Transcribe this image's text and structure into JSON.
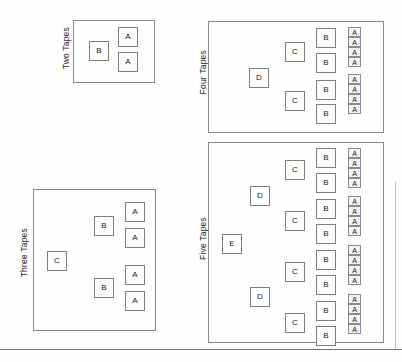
{
  "figure": {
    "background_color": "#fefefe",
    "line_color": "#8a8a8a",
    "node_fill": "#fdfdfd",
    "small_node_fill": "#f3f3f3",
    "text_color": "#171717"
  },
  "panels": [
    {
      "id": "two-tapes",
      "label": "Two Tapes",
      "x": 73,
      "y": 20,
      "w": 82,
      "h": 63,
      "label_x": 62,
      "label_y": 27,
      "nodes": [
        {
          "letter": "B",
          "size": "big",
          "x": 89,
          "y": 41
        },
        {
          "letter": "A",
          "size": "big",
          "x": 118,
          "y": 27
        },
        {
          "letter": "A",
          "size": "big",
          "x": 118,
          "y": 52
        }
      ]
    },
    {
      "id": "three-tapes",
      "label": "Three Tapes",
      "x": 33,
      "y": 189,
      "w": 123,
      "h": 142,
      "label_x": 20,
      "label_y": 228,
      "nodes": [
        {
          "letter": "C",
          "size": "big",
          "x": 47,
          "y": 251
        },
        {
          "letter": "B",
          "size": "big",
          "x": 94,
          "y": 216
        },
        {
          "letter": "B",
          "size": "big",
          "x": 94,
          "y": 278
        },
        {
          "letter": "A",
          "size": "big",
          "x": 125,
          "y": 202
        },
        {
          "letter": "A",
          "size": "big",
          "x": 125,
          "y": 228
        },
        {
          "letter": "A",
          "size": "big",
          "x": 125,
          "y": 265
        },
        {
          "letter": "A",
          "size": "big",
          "x": 125,
          "y": 291
        }
      ]
    },
    {
      "id": "four-tapes",
      "label": "Four Tapes",
      "x": 208,
      "y": 21,
      "w": 176,
      "h": 112,
      "label_x": 199,
      "label_y": 50,
      "nodes": [
        {
          "letter": "D",
          "size": "big",
          "x": 249,
          "y": 68
        },
        {
          "letter": "C",
          "size": "big",
          "x": 285,
          "y": 42
        },
        {
          "letter": "C",
          "size": "big",
          "x": 285,
          "y": 91
        },
        {
          "letter": "B",
          "size": "big",
          "x": 316,
          "y": 28
        },
        {
          "letter": "B",
          "size": "big",
          "x": 316,
          "y": 53
        },
        {
          "letter": "B",
          "size": "big",
          "x": 316,
          "y": 80
        },
        {
          "letter": "B",
          "size": "big",
          "x": 316,
          "y": 104
        },
        {
          "letter": "A",
          "size": "small",
          "x": 348,
          "y": 27
        },
        {
          "letter": "A",
          "size": "small",
          "x": 348,
          "y": 37
        },
        {
          "letter": "A",
          "size": "small",
          "x": 348,
          "y": 47
        },
        {
          "letter": "A",
          "size": "small",
          "x": 348,
          "y": 57
        },
        {
          "letter": "A",
          "size": "small",
          "x": 348,
          "y": 74
        },
        {
          "letter": "A",
          "size": "small",
          "x": 348,
          "y": 84
        },
        {
          "letter": "A",
          "size": "small",
          "x": 348,
          "y": 94
        },
        {
          "letter": "A",
          "size": "small",
          "x": 348,
          "y": 104
        }
      ]
    },
    {
      "id": "five-tapes",
      "label": "Five Tapes",
      "x": 208,
      "y": 142,
      "w": 176,
      "h": 201,
      "label_x": 199,
      "label_y": 217,
      "nodes": [
        {
          "letter": "E",
          "size": "big",
          "x": 222,
          "y": 234
        },
        {
          "letter": "D",
          "size": "big",
          "x": 250,
          "y": 186
        },
        {
          "letter": "D",
          "size": "big",
          "x": 250,
          "y": 287
        },
        {
          "letter": "C",
          "size": "big",
          "x": 285,
          "y": 160
        },
        {
          "letter": "C",
          "size": "big",
          "x": 285,
          "y": 211
        },
        {
          "letter": "C",
          "size": "big",
          "x": 285,
          "y": 262
        },
        {
          "letter": "C",
          "size": "big",
          "x": 285,
          "y": 313
        },
        {
          "letter": "B",
          "size": "big",
          "x": 316,
          "y": 148
        },
        {
          "letter": "B",
          "size": "big",
          "x": 316,
          "y": 173
        },
        {
          "letter": "B",
          "size": "big",
          "x": 316,
          "y": 199
        },
        {
          "letter": "B",
          "size": "big",
          "x": 316,
          "y": 224
        },
        {
          "letter": "B",
          "size": "big",
          "x": 316,
          "y": 250
        },
        {
          "letter": "B",
          "size": "big",
          "x": 316,
          "y": 275
        },
        {
          "letter": "B",
          "size": "big",
          "x": 316,
          "y": 301
        },
        {
          "letter": "B",
          "size": "big",
          "x": 316,
          "y": 326
        },
        {
          "letter": "A",
          "size": "small",
          "x": 348,
          "y": 148
        },
        {
          "letter": "A",
          "size": "small",
          "x": 348,
          "y": 158
        },
        {
          "letter": "A",
          "size": "small",
          "x": 348,
          "y": 168
        },
        {
          "letter": "A",
          "size": "small",
          "x": 348,
          "y": 178
        },
        {
          "letter": "A",
          "size": "small",
          "x": 348,
          "y": 196
        },
        {
          "letter": "A",
          "size": "small",
          "x": 348,
          "y": 206
        },
        {
          "letter": "A",
          "size": "small",
          "x": 348,
          "y": 216
        },
        {
          "letter": "A",
          "size": "small",
          "x": 348,
          "y": 226
        },
        {
          "letter": "A",
          "size": "small",
          "x": 348,
          "y": 245
        },
        {
          "letter": "A",
          "size": "small",
          "x": 348,
          "y": 255
        },
        {
          "letter": "A",
          "size": "small",
          "x": 348,
          "y": 265
        },
        {
          "letter": "A",
          "size": "small",
          "x": 348,
          "y": 275
        },
        {
          "letter": "A",
          "size": "small",
          "x": 348,
          "y": 294
        },
        {
          "letter": "A",
          "size": "small",
          "x": 348,
          "y": 304
        },
        {
          "letter": "A",
          "size": "small",
          "x": 348,
          "y": 314
        },
        {
          "letter": "A",
          "size": "small",
          "x": 348,
          "y": 324
        }
      ]
    }
  ],
  "rules": [
    {
      "id": "bottom-rule",
      "type": "horizontal",
      "y": 349
    },
    {
      "id": "right-edge-rule",
      "type": "vertical",
      "x": 395,
      "y": 182,
      "h": 167
    }
  ]
}
